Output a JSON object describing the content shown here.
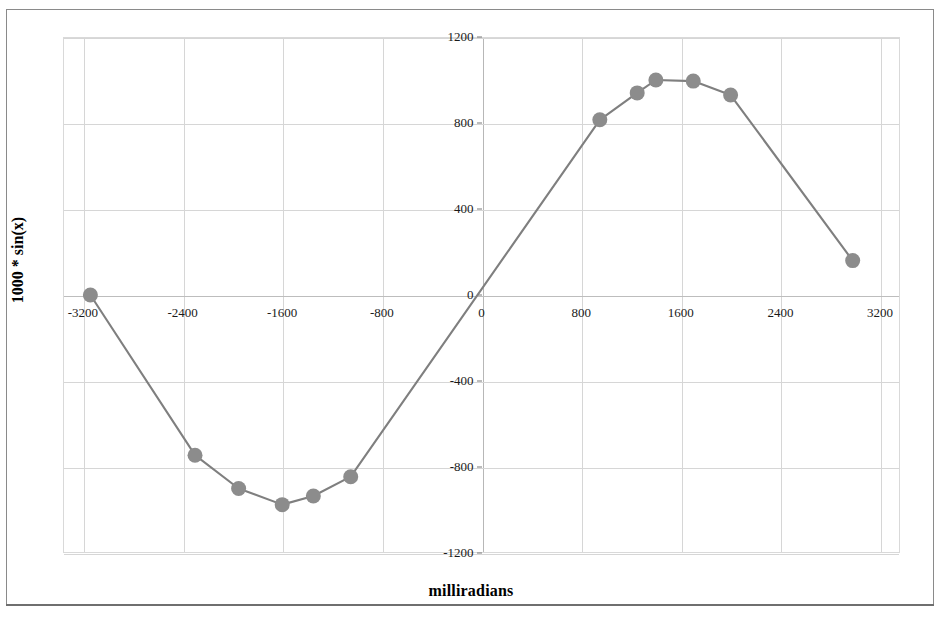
{
  "chart_data": {
    "type": "line",
    "title": "",
    "xlabel": "milliradians",
    "ylabel": "1000 * sin(x)",
    "xlim": [
      -3360,
      3360
    ],
    "ylim": [
      -1200,
      1200
    ],
    "grid": true,
    "legend": false,
    "marker": "circle",
    "marker_color": "#8c8c8c",
    "line_color": "#7f7f7f",
    "xticks": [
      "-3200",
      "-2400",
      "-1600",
      "-800",
      "0",
      "800",
      "1600",
      "2400",
      "3200"
    ],
    "xtick_values": [
      -3200,
      -2400,
      -1600,
      -800,
      0,
      800,
      1600,
      2400,
      3200
    ],
    "yticks": [
      "1200",
      "800",
      "400",
      "0",
      "-400",
      "-800",
      "-1200"
    ],
    "ytick_values": [
      1200,
      800,
      400,
      0,
      -400,
      -800,
      -1200
    ],
    "series": [
      {
        "name": "1000 * sin(x)",
        "points": [
          {
            "x": -3140,
            "y": 0
          },
          {
            "x": -2300,
            "y": -745
          },
          {
            "x": -1950,
            "y": -900
          },
          {
            "x": -1600,
            "y": -975
          },
          {
            "x": -1350,
            "y": -935
          },
          {
            "x": -1050,
            "y": -845
          },
          {
            "x": 950,
            "y": 815
          },
          {
            "x": 1250,
            "y": 940
          },
          {
            "x": 1400,
            "y": 1000
          },
          {
            "x": 1700,
            "y": 995
          },
          {
            "x": 2000,
            "y": 930
          },
          {
            "x": 2980,
            "y": 160
          }
        ]
      }
    ]
  },
  "axes": {
    "x_title": "milliradians",
    "y_title": "1000 * sin(x)"
  }
}
